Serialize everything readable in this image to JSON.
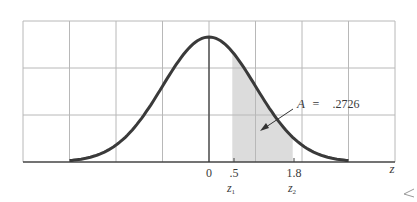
{
  "chart_data": {
    "type": "area",
    "title": "",
    "xlabel": "z",
    "ylabel": "",
    "distribution": "standard normal",
    "x_range": [
      -3,
      3
    ],
    "xlim": [
      -4,
      4
    ],
    "grid": true,
    "grid_columns": 8,
    "grid_rows": 3,
    "shaded_region": {
      "from": 0.5,
      "to": 1.8
    },
    "tick_labels": [
      {
        "z": 0,
        "label": "0",
        "sub": ""
      },
      {
        "z": 0.5,
        "label": ".5",
        "sub": "z1"
      },
      {
        "z": 1.8,
        "label": "1.8",
        "sub": "z2"
      }
    ],
    "annotation": {
      "text": "A = .2726",
      "var": "A",
      "eq": "=",
      "value": ".2726",
      "area": 0.2726
    },
    "colors": {
      "curve": "#3a3a3a",
      "shade": "#dcdcdc",
      "grid": "#b8b8b8",
      "axis": "#444444"
    }
  },
  "labels": {
    "zero": "0",
    "z1_value": ".5",
    "z2_value": "1.8",
    "z1_name": "z",
    "z1_sub": "1",
    "z2_name": "z",
    "z2_sub": "2",
    "axis_name": "z",
    "ann_var": "A",
    "ann_eq": "=",
    "ann_value": ".2726"
  }
}
